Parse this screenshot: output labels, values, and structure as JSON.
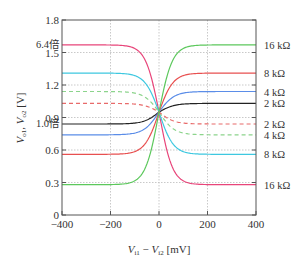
{
  "chart_data": {
    "type": "line",
    "title": "",
    "xlabel": "V_i1 − V_i2 [mV]",
    "xlabel_parts": {
      "v1": "V",
      "s1": "i1",
      "minus": " − ",
      "v2": "V",
      "s2": "i2",
      "unit": " [mV]"
    },
    "ylabel": "V_o1, V_o2 [V]",
    "ylabel_parts": {
      "v1": "V",
      "s1": "o1",
      "sep": ", ",
      "v2": "V",
      "s2": "o2",
      "unit": " [V]"
    },
    "xlim": [
      -400,
      400
    ],
    "ylim": [
      0,
      1.8
    ],
    "xticks": [
      -400,
      -200,
      0,
      200,
      400
    ],
    "xtick_labels": [
      "−400",
      "−200",
      "0",
      "200",
      "400"
    ],
    "yticks": [
      0,
      0.3,
      0.6,
      0.9,
      1.2,
      1.5,
      1.8
    ],
    "ytick_labels": [
      "0",
      "0.3",
      "0.6",
      "0.9",
      "1.2",
      "1.5",
      "1.8"
    ],
    "grid": true,
    "crossing": {
      "x": 0,
      "y": 0.95
    },
    "annotations": [
      {
        "text": "6.4倍",
        "y": 1.57
      },
      {
        "text": "1.0倍",
        "y": 0.84
      }
    ],
    "series": [
      {
        "name": "16 kΩ (V_o1)",
        "color": "#e8457a",
        "dashed": false,
        "left": 1.57,
        "right": 0.28,
        "steep": 0.018,
        "label": "16 kΩ"
      },
      {
        "name": "8 kΩ (V_o1)",
        "color": "#3ec8e0",
        "dashed": false,
        "left": 1.31,
        "right": 0.56,
        "steep": 0.017,
        "label": "8 kΩ"
      },
      {
        "name": "4 kΩ (V_o1)",
        "color": "#8cd48c",
        "dashed": true,
        "left": 1.14,
        "right": 0.74,
        "steep": 0.016,
        "label": "4 kΩ"
      },
      {
        "name": "2 kΩ (V_o1)",
        "color": "#e86a6a",
        "dashed": true,
        "left": 1.03,
        "right": 0.84,
        "steep": 0.016,
        "label": "2 kΩ"
      },
      {
        "name": "2 kΩ (V_o2)",
        "color": "#222222",
        "dashed": false,
        "left": 0.84,
        "right": 1.03,
        "steep": 0.016,
        "label": "2 kΩ"
      },
      {
        "name": "4 kΩ (V_o2)",
        "color": "#5b8de8",
        "dashed": false,
        "left": 0.74,
        "right": 1.14,
        "steep": 0.016,
        "label": "4 kΩ"
      },
      {
        "name": "8 kΩ (V_o2)",
        "color": "#e85050",
        "dashed": false,
        "left": 0.56,
        "right": 1.31,
        "steep": 0.017,
        "label": "8 kΩ"
      },
      {
        "name": "16 kΩ (V_o2)",
        "color": "#5cc85c",
        "dashed": false,
        "left": 0.28,
        "right": 1.57,
        "steep": 0.018,
        "label": "16 kΩ"
      }
    ],
    "right_labels": [
      {
        "text": "16 kΩ",
        "y": 1.57
      },
      {
        "text": "8 kΩ",
        "y": 1.31
      },
      {
        "text": "4 kΩ",
        "y": 1.14
      },
      {
        "text": "2 kΩ",
        "y": 1.03
      },
      {
        "text": "2 kΩ",
        "y": 0.84
      },
      {
        "text": "4 kΩ",
        "y": 0.74
      },
      {
        "text": "8 kΩ",
        "y": 0.56
      },
      {
        "text": "16 kΩ",
        "y": 0.28
      }
    ]
  }
}
